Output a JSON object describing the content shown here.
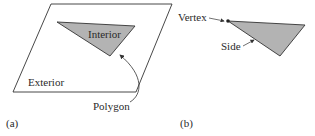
{
  "panel_a": {
    "caption": "(a)",
    "labels": {
      "interior": "Interior",
      "exterior": "Exterior",
      "polygon": "Polygon"
    }
  },
  "panel_b": {
    "caption": "(b)",
    "labels": {
      "vertex": "Vertex",
      "side": "Side"
    }
  },
  "colors": {
    "fill": "#b3b3b3",
    "stroke": "#333333"
  }
}
